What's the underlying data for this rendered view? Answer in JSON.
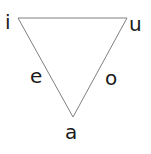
{
  "diagram": {
    "type": "vowel-triangle",
    "background_color": "#ffffff",
    "shape": {
      "name": "inverted-triangle",
      "stroke_color": "#808080",
      "stroke_width": 1,
      "fill": "none",
      "points": "18,18 127,18 73,117",
      "vertices": [
        {
          "name": "top-left",
          "x": 18,
          "y": 18
        },
        {
          "name": "top-right",
          "x": 127,
          "y": 18
        },
        {
          "name": "bottom",
          "x": 73,
          "y": 117
        }
      ]
    },
    "labels": [
      {
        "id": "i",
        "text": "i",
        "position": "top-left",
        "x": 5,
        "y": 12
      },
      {
        "id": "u",
        "text": "u",
        "position": "top-right",
        "x": 129,
        "y": 14
      },
      {
        "id": "e",
        "text": "e",
        "position": "left-edge",
        "x": 30,
        "y": 66
      },
      {
        "id": "o",
        "text": "o",
        "position": "right-edge",
        "x": 105,
        "y": 68
      },
      {
        "id": "a",
        "text": "a",
        "position": "bottom-apex",
        "x": 65,
        "y": 122
      }
    ],
    "text_color": "#1a1a1a",
    "font_size_px": 20
  }
}
